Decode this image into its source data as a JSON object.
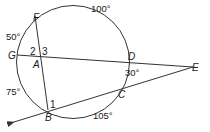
{
  "diagram": {
    "type": "circle-secants-chords",
    "points": {
      "F": "F",
      "G": "G",
      "A": "A",
      "D": "D",
      "E": "E",
      "C": "C",
      "B": "B"
    },
    "angle_labels": {
      "angle1": "1",
      "angle2": "2",
      "angle3": "3"
    },
    "arc_measures": {
      "arc_FD": "100°",
      "arc_GF": "50°",
      "arc_DC": "30°",
      "arc_GB": "75°",
      "arc_BC": "105°"
    },
    "colors": {
      "stroke": "#333333",
      "text": "#1a1a1a",
      "background": "#ffffff"
    }
  }
}
